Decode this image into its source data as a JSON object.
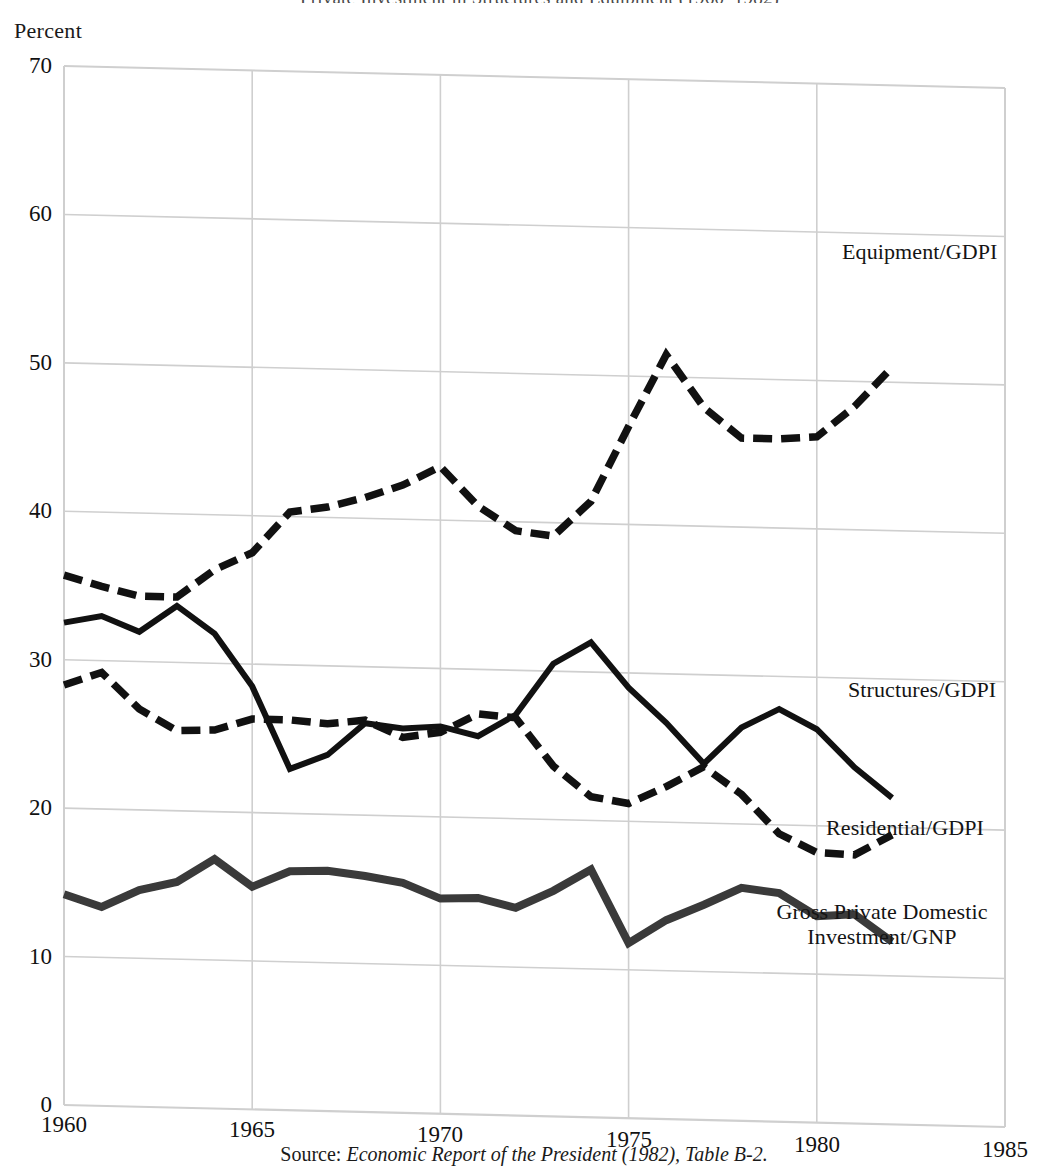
{
  "figure": {
    "clipped_title": "Private Investment in Structures and Equipment (1960–1982)",
    "y_axis_title": "Percent",
    "source_prefix": "Source:",
    "source_text": "Economic Report of the President (1982), Table B-2."
  },
  "labels": {
    "equipment": "Equipment/GDPI",
    "structures": "Structures/GDPI",
    "residential": "Residential/GDPI",
    "gpdi_line1": "Gross Private Domestic",
    "gpdi_line2": "Investment/GNP"
  },
  "colors": {
    "ink": "#111111",
    "grid": "#cfcfcf",
    "gpdi": "#3a3a3a",
    "background": "#ffffff"
  },
  "chart_data": {
    "type": "line",
    "title": "Private Investment in Structures and Equipment (1960–1982)",
    "xlabel": "",
    "ylabel": "Percent",
    "xlim": [
      1960,
      1985
    ],
    "ylim": [
      0,
      70
    ],
    "xticks": [
      1960,
      1965,
      1970,
      1975,
      1980,
      1985
    ],
    "yticks": [
      0,
      10,
      20,
      30,
      40,
      50,
      60,
      70
    ],
    "grid": true,
    "legend": "inline-annotations",
    "x": [
      1960,
      1961,
      1962,
      1963,
      1964,
      1965,
      1966,
      1967,
      1968,
      1969,
      1970,
      1971,
      1972,
      1973,
      1974,
      1975,
      1976,
      1977,
      1978,
      1979,
      1980,
      1981,
      1982
    ],
    "series": [
      {
        "name": "Equipment/GDPI",
        "style": "dashed",
        "values": [
          35.7,
          35.0,
          34.4,
          34.4,
          36.3,
          37.5,
          40.3,
          40.7,
          41.4,
          42.3,
          43.6,
          41.0,
          39.4,
          39.1,
          41.5,
          46.6,
          51.5,
          48.0,
          46.0,
          46.0,
          46.2,
          48.3,
          51.0
        ]
      },
      {
        "name": "Structures/GDPI",
        "style": "solid",
        "values": [
          32.5,
          33.0,
          32.0,
          33.8,
          32.0,
          28.5,
          23.0,
          24.0,
          26.2,
          25.9,
          26.1,
          25.5,
          27.0,
          30.5,
          32.0,
          29.0,
          26.7,
          24.0,
          26.5,
          27.8,
          26.5,
          24.0,
          22.0
        ]
      },
      {
        "name": "Residential/GDPI",
        "style": "dashed",
        "values": [
          28.3,
          29.2,
          26.8,
          25.4,
          25.5,
          26.3,
          26.3,
          26.1,
          26.4,
          25.3,
          25.7,
          27.0,
          26.8,
          23.6,
          21.6,
          21.2,
          22.4,
          23.8,
          22.0,
          19.4,
          18.2,
          18.1,
          19.5
        ]
      },
      {
        "name": "Gross Private Domestic Investment/GNP",
        "style": "solid-thick",
        "values": [
          14.2,
          13.4,
          14.6,
          15.2,
          16.8,
          15.0,
          16.1,
          16.2,
          15.9,
          15.5,
          14.5,
          14.6,
          14.0,
          15.2,
          16.7,
          11.8,
          13.4,
          14.5,
          15.7,
          15.4,
          13.9,
          14.1,
          12.3
        ]
      }
    ]
  }
}
